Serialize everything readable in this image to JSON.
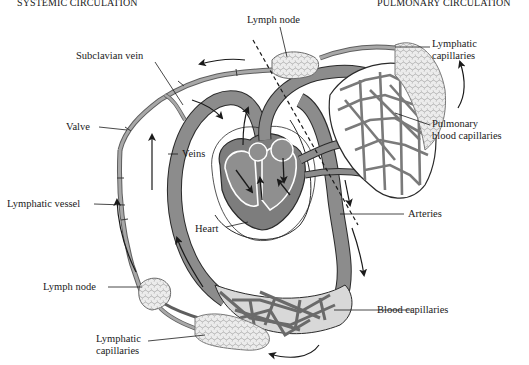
{
  "diagram": {
    "title_left": "SYSTEMIC CIRCULATION",
    "title_right": "PULMONARY CIRCULATION",
    "colors": {
      "blood_vessel": "#8c8c8c",
      "blood_vessel_dark": "#5e5e5e",
      "lymph_fill": "#e6e6e6",
      "lymph_edge": "#7a7a7a",
      "heart_fill": "#7d7d7d",
      "outline": "#2a2a2a",
      "background": "#ffffff"
    },
    "labels": {
      "lymph_node_top": "Lymph node",
      "lymphatic_capillaries_top": "Lymphatic\ncapillaries",
      "subclavian_vein": "Subclavian vein",
      "pulmonary_blood_capillaries": "Pulmonary\nblood capillaries",
      "valve": "Valve",
      "veins": "Veins",
      "lymphatic_vessel": "Lymphatic vessel",
      "heart": "Heart",
      "arteries": "Arteries",
      "lymph_node_bottom": "Lymph node",
      "blood_capillaries": "Blood capillaries",
      "lymphatic_capillaries_bottom": "Lymphatic\ncapillaries"
    }
  }
}
